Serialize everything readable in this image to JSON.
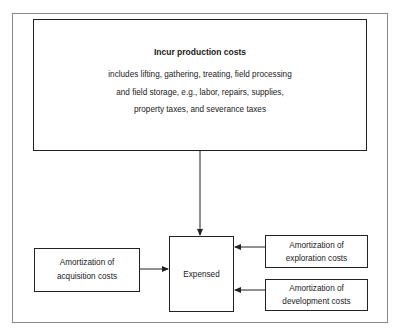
{
  "diagram": {
    "top_box": {
      "title": "Incur production costs",
      "lines": [
        "includes lifting, gathering, treating, field processing",
        "and field storage, e.g., labor, repairs, supplies,",
        "property taxes, and severance taxes"
      ]
    },
    "center_box": {
      "label": "Expensed"
    },
    "left_box": {
      "lines": [
        "Amortization of",
        "acquisition costs"
      ]
    },
    "right_top_box": {
      "lines": [
        "Amortization of",
        "exploration costs"
      ]
    },
    "right_bottom_box": {
      "lines": [
        "Amortization of",
        "development costs"
      ]
    },
    "edges": [
      {
        "from": "top_box",
        "to": "center_box"
      },
      {
        "from": "left_box",
        "to": "center_box"
      },
      {
        "from": "right_top_box",
        "to": "center_box"
      },
      {
        "from": "right_bottom_box",
        "to": "center_box"
      }
    ],
    "colors": {
      "line": "#222222",
      "frame": "#8a8a8a",
      "background": "#ffffff"
    }
  }
}
